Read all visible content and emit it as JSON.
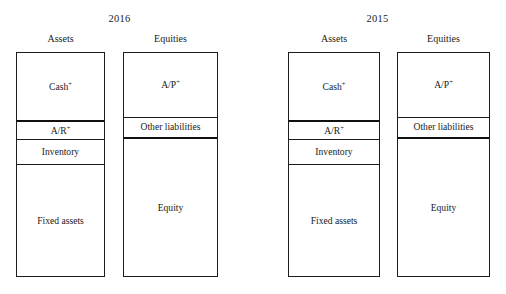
{
  "figure": {
    "type": "stacked-balance-sheet-diagram",
    "background": "#ffffff",
    "line_color": "#1c1c1c"
  },
  "panels": [
    {
      "id": "panel-2016",
      "year": "2016",
      "columns": [
        {
          "id": "assets",
          "heading": "Assets",
          "segments": [
            {
              "name": "cash",
              "label": "Cash",
              "superscript": "+",
              "height_pct": 31.0,
              "divider": "thick"
            },
            {
              "name": "accounts-receivable",
              "label": "A/R",
              "superscript": "+",
              "height_pct": 8.2,
              "divider": "thin"
            },
            {
              "name": "inventory",
              "label": "Inventory",
              "superscript": "",
              "height_pct": 11.0,
              "divider": "thin"
            },
            {
              "name": "fixed-assets",
              "label": "Fixed assets",
              "superscript": "",
              "height_pct": 49.8,
              "divider": "none"
            }
          ]
        },
        {
          "id": "equities",
          "heading": "Equities",
          "segments": [
            {
              "name": "accounts-payable",
              "label": "A/P",
              "superscript": "+",
              "height_pct": 29.0,
              "divider": "thin"
            },
            {
              "name": "other-liabilities",
              "label": "Other liabilities",
              "superscript": "",
              "height_pct": 9.5,
              "divider": "thick"
            },
            {
              "name": "equity",
              "label": "Equity",
              "superscript": "",
              "height_pct": 61.5,
              "divider": "none"
            }
          ]
        }
      ]
    },
    {
      "id": "panel-2015",
      "year": "2015",
      "columns": [
        {
          "id": "assets",
          "heading": "Assets",
          "segments": [
            {
              "name": "cash",
              "label": "Cash",
              "superscript": "+",
              "height_pct": 31.0,
              "divider": "thick"
            },
            {
              "name": "accounts-receivable",
              "label": "A/R",
              "superscript": "+",
              "height_pct": 8.2,
              "divider": "thin"
            },
            {
              "name": "inventory",
              "label": "Inventory",
              "superscript": "",
              "height_pct": 11.0,
              "divider": "thin"
            },
            {
              "name": "fixed-assets",
              "label": "Fixed assets",
              "superscript": "",
              "height_pct": 49.8,
              "divider": "none"
            }
          ]
        },
        {
          "id": "equities",
          "heading": "Equities",
          "segments": [
            {
              "name": "accounts-payable",
              "label": "A/P",
              "superscript": "+",
              "height_pct": 29.0,
              "divider": "thin"
            },
            {
              "name": "other-liabilities",
              "label": "Other liabilities",
              "superscript": "",
              "height_pct": 9.5,
              "divider": "thick"
            },
            {
              "name": "equity",
              "label": "Equity",
              "superscript": "",
              "height_pct": 61.5,
              "divider": "none"
            }
          ]
        }
      ]
    }
  ],
  "geometry": {
    "box_top": 52,
    "box_bottom": 277,
    "panel_2016": {
      "assets_left": 16,
      "assets_right": 105,
      "equities_left": 123,
      "equities_right": 218
    },
    "panel_2015": {
      "assets_left": 35,
      "assets_right": 127,
      "equities_left": 144,
      "equities_right": 237
    }
  }
}
